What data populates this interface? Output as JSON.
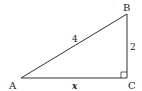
{
  "diagram": {
    "type": "right-triangle",
    "vertices": [
      {
        "label": "A",
        "x": 21,
        "y": 78
      },
      {
        "label": "B",
        "x": 127,
        "y": 14
      },
      {
        "label": "C",
        "x": 127,
        "y": 78
      }
    ],
    "sides": {
      "AB": {
        "label": "4"
      },
      "BC": {
        "label": "2"
      },
      "AC": {
        "label": "x"
      }
    },
    "right_angle_at": "C",
    "stroke_color": "#333333"
  }
}
